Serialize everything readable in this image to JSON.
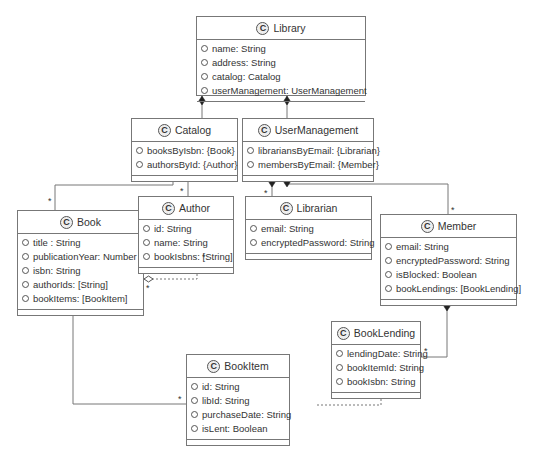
{
  "diagram": {
    "type": "UML class diagram",
    "classes": [
      {
        "name": "Library",
        "stereotype_icon": "C",
        "attributes": [
          "name: String",
          "address: String",
          "catalog: Catalog",
          "userManagement: UserManagement"
        ]
      },
      {
        "name": "Catalog",
        "stereotype_icon": "C",
        "attributes": [
          "booksByIsbn: {Book}",
          "authorsById: {Author}"
        ]
      },
      {
        "name": "UserManagement",
        "stereotype_icon": "C",
        "attributes": [
          "librariansByEmail: {Librarian}",
          "membersByEmail: {Member}"
        ]
      },
      {
        "name": "Book",
        "stereotype_icon": "C",
        "attributes": [
          "title : String",
          "publicationYear: Number",
          "isbn: String",
          "authorIds: [String]",
          "bookItems: [BookItem]"
        ]
      },
      {
        "name": "Author",
        "stereotype_icon": "C",
        "attributes": [
          "id: String",
          "name: String",
          "bookIsbns: [String]"
        ]
      },
      {
        "name": "Librarian",
        "stereotype_icon": "C",
        "attributes": [
          "email: String",
          "encryptedPassword: String"
        ]
      },
      {
        "name": "Member",
        "stereotype_icon": "C",
        "attributes": [
          "email: String",
          "encryptedPassword: String",
          "isBlocked: Boolean",
          "bookLendings: [BookLending]"
        ]
      },
      {
        "name": "BookLending",
        "stereotype_icon": "C",
        "attributes": [
          "lendingDate: String",
          "bookItemId: String",
          "bookIsbn: String"
        ]
      },
      {
        "name": "BookItem",
        "stereotype_icon": "C",
        "attributes": [
          "id: String",
          "libId: String",
          "purchaseDate: String",
          "isLent: Boolean"
        ]
      }
    ],
    "relations": [
      {
        "from": "Library",
        "to": "Catalog",
        "kind": "composition"
      },
      {
        "from": "Library",
        "to": "UserManagement",
        "kind": "composition"
      },
      {
        "from": "Catalog",
        "to": "Book",
        "kind": "composition",
        "multiplicity": "*"
      },
      {
        "from": "Catalog",
        "to": "Author",
        "kind": "composition",
        "multiplicity": "*"
      },
      {
        "from": "UserManagement",
        "to": "Librarian",
        "kind": "composition",
        "multiplicity": "*"
      },
      {
        "from": "UserManagement",
        "to": "Member",
        "kind": "composition",
        "multiplicity": "*"
      },
      {
        "from": "Book",
        "to": "Author",
        "kind": "aggregation",
        "style": "dashed",
        "multiplicity": "*"
      },
      {
        "from": "Book",
        "to": "BookItem",
        "kind": "composition",
        "multiplicity": "*"
      },
      {
        "from": "Member",
        "to": "BookLending",
        "kind": "composition",
        "multiplicity": "*"
      },
      {
        "from": "BookLending",
        "to": "BookItem",
        "kind": "aggregation",
        "style": "dashed"
      }
    ],
    "multiplicity_label": "*"
  }
}
